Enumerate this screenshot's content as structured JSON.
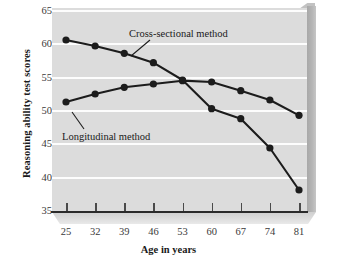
{
  "top_sliver_text": "",
  "chart_data": {
    "type": "line",
    "title": "",
    "xlabel": "Age in years",
    "ylabel": "Reasoning ability test scores",
    "x": [
      25,
      32,
      39,
      46,
      53,
      60,
      67,
      74,
      81
    ],
    "xtick_labels": [
      "25",
      "32",
      "39",
      "46",
      "53",
      "60",
      "67",
      "74",
      "81"
    ],
    "ytick_labels": [
      "35",
      "40",
      "45",
      "50",
      "55",
      "60",
      "65"
    ],
    "yticks": [
      35,
      40,
      45,
      50,
      55,
      60,
      65
    ],
    "xlim": [
      25,
      81
    ],
    "ylim": [
      35,
      65
    ],
    "grid": true,
    "legend_position": "inline-annotations",
    "series": [
      {
        "name": "Cross-sectional method",
        "values": [
          60.5,
          59.6,
          58.5,
          57.1,
          54.5,
          50.2,
          48.7,
          44.3,
          38.0
        ],
        "color": "#1c1c1c",
        "marker": "filled-circle",
        "annotation": "Cross-sectional method"
      },
      {
        "name": "Longitudinal method",
        "values": [
          51.2,
          52.4,
          53.4,
          53.9,
          54.4,
          54.2,
          52.9,
          51.5,
          49.2
        ],
        "color": "#1c1c1c",
        "marker": "filled-circle",
        "annotation": "Longitudinal method"
      }
    ],
    "annotations": [
      {
        "text": "Cross-sectional method",
        "points_to_series": "Cross-sectional method",
        "points_to_x": 39
      },
      {
        "text": "Longitudinal method",
        "points_to_series": "Longitudinal method",
        "points_to_x": 25
      }
    ],
    "style": {
      "plot_background": "#dcdcdc",
      "gridline_color": "#fdfdfd",
      "axis_color": "#2b2b2b",
      "three_d_side_face": "#b5b5b5",
      "three_d_bottom_face": "#dedede",
      "page_background": "#ffffff"
    }
  }
}
